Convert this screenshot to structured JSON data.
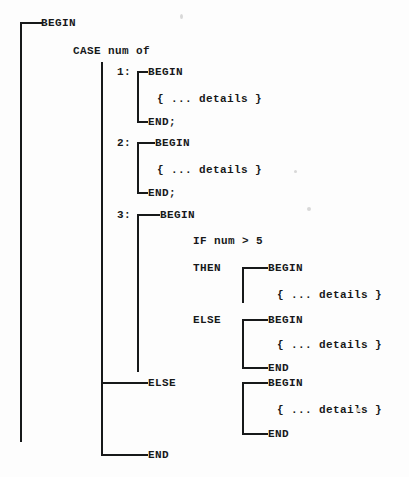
{
  "diagram": {
    "language_keywords": [
      "BEGIN",
      "CASE",
      "END",
      "IF",
      "THEN",
      "ELSE"
    ],
    "ink_color": "#17191a",
    "background_color": "#fdfdfd",
    "canvas": {
      "width": 409,
      "height": 477
    },
    "labels": [
      {
        "id": "outer-begin",
        "text": "BEGIN",
        "x": 41,
        "y": 23
      },
      {
        "id": "case-header",
        "text": "CASE num of",
        "x": 73,
        "y": 51
      },
      {
        "id": "case-1-label",
        "text": "1:",
        "x": 117,
        "y": 72
      },
      {
        "id": "case-1-begin",
        "text": "BEGIN",
        "x": 148,
        "y": 72
      },
      {
        "id": "case-1-details",
        "text": "{ ... details }",
        "x": 157,
        "y": 99
      },
      {
        "id": "case-1-end",
        "text": "END;",
        "x": 148,
        "y": 122
      },
      {
        "id": "case-2-label",
        "text": "2:",
        "x": 117,
        "y": 143
      },
      {
        "id": "case-2-begin",
        "text": "BEGIN",
        "x": 155,
        "y": 143
      },
      {
        "id": "case-2-details",
        "text": "{ ... details }",
        "x": 157,
        "y": 170
      },
      {
        "id": "case-2-end",
        "text": "END;",
        "x": 148,
        "y": 193
      },
      {
        "id": "case-3-label",
        "text": "3:",
        "x": 117,
        "y": 215
      },
      {
        "id": "case-3-begin",
        "text": "BEGIN",
        "x": 160,
        "y": 215
      },
      {
        "id": "if-condition",
        "text": "IF num > 5",
        "x": 193,
        "y": 241
      },
      {
        "id": "then-keyword",
        "text": "THEN",
        "x": 193,
        "y": 268
      },
      {
        "id": "then-begin",
        "text": "BEGIN",
        "x": 268,
        "y": 268
      },
      {
        "id": "then-details",
        "text": "{ ... details }",
        "x": 277,
        "y": 295
      },
      {
        "id": "else-keyword",
        "text": "ELSE",
        "x": 193,
        "y": 320
      },
      {
        "id": "inner-else-begin",
        "text": "BEGIN",
        "x": 268,
        "y": 320
      },
      {
        "id": "inner-else-details",
        "text": "{ ... details }",
        "x": 277,
        "y": 345
      },
      {
        "id": "inner-else-end",
        "text": "END",
        "x": 268,
        "y": 368
      },
      {
        "id": "case-else-keyword",
        "text": "ELSE",
        "x": 148,
        "y": 383
      },
      {
        "id": "case-else-begin",
        "text": "BEGIN",
        "x": 268,
        "y": 383
      },
      {
        "id": "case-else-details",
        "text": "{ ... details }",
        "x": 277,
        "y": 410
      },
      {
        "id": "case-else-end",
        "text": "END",
        "x": 268,
        "y": 434
      },
      {
        "id": "case-end",
        "text": "END",
        "x": 148,
        "y": 455
      }
    ],
    "connectors": {
      "vertical": [
        {
          "id": "outer-spine",
          "x": 20,
          "y1": 23,
          "y2": 442
        },
        {
          "id": "case-spine",
          "x": 101,
          "y1": 62,
          "y2": 455
        },
        {
          "id": "case-1-bracket",
          "x": 137,
          "y1": 72,
          "y2": 122
        },
        {
          "id": "case-2-bracket",
          "x": 137,
          "y1": 143,
          "y2": 193
        },
        {
          "id": "case-3-bracket",
          "x": 137,
          "y1": 215,
          "y2": 372
        },
        {
          "id": "then-bracket",
          "x": 242,
          "y1": 268,
          "y2": 303
        },
        {
          "id": "inner-else-bracket",
          "x": 242,
          "y1": 320,
          "y2": 368
        },
        {
          "id": "case-else-bracket",
          "x": 242,
          "y1": 383,
          "y2": 434
        }
      ],
      "horizontal": [
        {
          "id": "outer-begin-stub",
          "x1": 20,
          "x2": 41,
          "y": 23
        },
        {
          "id": "case-1-begin-stub",
          "x1": 137,
          "x2": 148,
          "y": 72
        },
        {
          "id": "case-1-end-stub",
          "x1": 137,
          "x2": 148,
          "y": 122
        },
        {
          "id": "case-2-begin-stub",
          "x1": 137,
          "x2": 155,
          "y": 143
        },
        {
          "id": "case-2-end-stub",
          "x1": 137,
          "x2": 148,
          "y": 193
        },
        {
          "id": "case-3-begin-stub",
          "x1": 137,
          "x2": 160,
          "y": 215
        },
        {
          "id": "then-begin-stub",
          "x1": 242,
          "x2": 268,
          "y": 268
        },
        {
          "id": "inner-else-begin-stub",
          "x1": 242,
          "x2": 268,
          "y": 320
        },
        {
          "id": "inner-else-end-stub",
          "x1": 242,
          "x2": 268,
          "y": 368
        },
        {
          "id": "case-else-branch",
          "x1": 101,
          "x2": 148,
          "y": 383
        },
        {
          "id": "case-else-begin-stub",
          "x1": 242,
          "x2": 268,
          "y": 383
        },
        {
          "id": "case-else-end-stub",
          "x1": 242,
          "x2": 268,
          "y": 434
        },
        {
          "id": "case-end-branch",
          "x1": 101,
          "x2": 148,
          "y": 455
        }
      ]
    }
  }
}
